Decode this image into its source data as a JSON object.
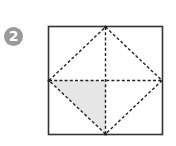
{
  "step": {
    "number": "2",
    "badge_color": "#9a9a9a"
  },
  "figure": {
    "square": {
      "x": 48,
      "y": 26,
      "w": 115,
      "h": 109,
      "stroke": "#333333"
    },
    "dash_color": "#222222",
    "shade_color": "#e6e6e6"
  }
}
